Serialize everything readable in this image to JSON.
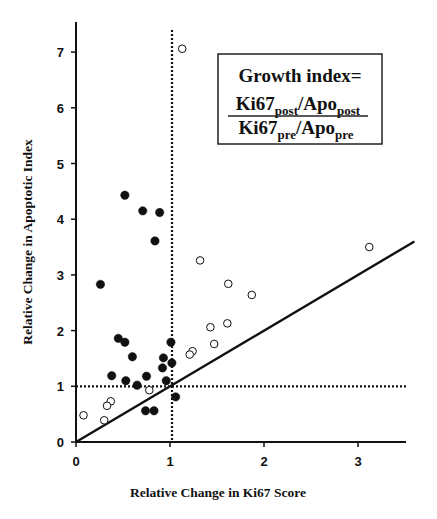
{
  "chart_data": {
    "type": "scatter",
    "title": "",
    "xlabel": "Relative Change in Ki67 Score",
    "ylabel": "Relative Change in Apoptotic Index",
    "xlim": [
      0,
      3.5
    ],
    "ylim": [
      0,
      7.4
    ],
    "x_ticks": [
      "0",
      "1",
      "2",
      "3"
    ],
    "y_ticks": [
      "0",
      "1",
      "2",
      "3",
      "4",
      "5",
      "6",
      "7"
    ],
    "grid": false,
    "legend": null,
    "reference_lines": [
      {
        "type": "vertical",
        "style": "dotted",
        "x": 1.0
      },
      {
        "type": "horizontal",
        "style": "dotted",
        "y": 1.0
      },
      {
        "type": "identity",
        "style": "solid",
        "label": "y = x",
        "from": [
          0,
          0
        ],
        "to": [
          3.6,
          3.6
        ]
      }
    ],
    "annotation": {
      "title": "Growth index=",
      "numerator": {
        "a": "Ki67",
        "a_sub": "post",
        "sep": "/",
        "b": "Apo",
        "b_sub": "post"
      },
      "denominator": {
        "a": "Ki67",
        "a_sub": "pre",
        "sep": "/",
        "b": "Apo",
        "b_sub": "pre"
      }
    },
    "series": [
      {
        "name": "filled circles",
        "marker": "filled",
        "points": [
          {
            "x": 0.26,
            "y": 2.83
          },
          {
            "x": 0.52,
            "y": 4.43
          },
          {
            "x": 0.71,
            "y": 4.15
          },
          {
            "x": 0.89,
            "y": 4.12
          },
          {
            "x": 0.84,
            "y": 3.61
          },
          {
            "x": 0.45,
            "y": 1.86
          },
          {
            "x": 0.52,
            "y": 1.79
          },
          {
            "x": 0.6,
            "y": 1.53
          },
          {
            "x": 1.01,
            "y": 1.79
          },
          {
            "x": 0.93,
            "y": 1.51
          },
          {
            "x": 1.02,
            "y": 1.42
          },
          {
            "x": 0.92,
            "y": 1.33
          },
          {
            "x": 0.38,
            "y": 1.19
          },
          {
            "x": 0.53,
            "y": 1.1
          },
          {
            "x": 0.65,
            "y": 1.02
          },
          {
            "x": 0.75,
            "y": 1.18
          },
          {
            "x": 0.96,
            "y": 1.1
          },
          {
            "x": 1.06,
            "y": 0.81
          },
          {
            "x": 0.74,
            "y": 0.56
          },
          {
            "x": 0.83,
            "y": 0.56
          }
        ]
      },
      {
        "name": "open circles",
        "marker": "open",
        "points": [
          {
            "x": 1.13,
            "y": 7.06
          },
          {
            "x": 1.32,
            "y": 3.26
          },
          {
            "x": 3.12,
            "y": 3.5
          },
          {
            "x": 1.62,
            "y": 2.84
          },
          {
            "x": 1.87,
            "y": 2.64
          },
          {
            "x": 1.61,
            "y": 2.13
          },
          {
            "x": 1.43,
            "y": 2.06
          },
          {
            "x": 1.47,
            "y": 1.76
          },
          {
            "x": 1.24,
            "y": 1.63
          },
          {
            "x": 1.21,
            "y": 1.57
          },
          {
            "x": 0.78,
            "y": 0.93
          },
          {
            "x": 0.37,
            "y": 0.73
          },
          {
            "x": 0.33,
            "y": 0.65
          },
          {
            "x": 0.08,
            "y": 0.48
          },
          {
            "x": 0.3,
            "y": 0.39
          }
        ]
      }
    ]
  },
  "page": {
    "corner_fragment": "..."
  }
}
